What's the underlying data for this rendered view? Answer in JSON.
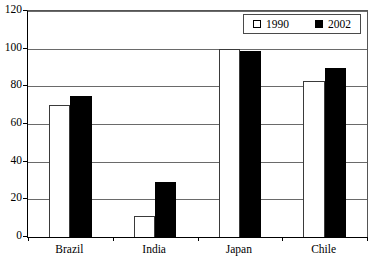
{
  "chart_data": {
    "type": "bar",
    "title": "",
    "subtitle": "",
    "xlabel": "",
    "ylabel": "",
    "categories": [
      "Brazil",
      "India",
      "Japan",
      "Chile"
    ],
    "series": [
      {
        "name": "1990",
        "values": [
          70,
          11,
          100,
          83
        ],
        "fill": "#ffffff",
        "stroke": "#3a3a3a"
      },
      {
        "name": "2002",
        "values": [
          75,
          29,
          99,
          90
        ],
        "fill": "#000000",
        "stroke": "#000000"
      }
    ],
    "ylim": [
      0,
      120
    ],
    "yticks": [
      0,
      20,
      40,
      60,
      80,
      100,
      120
    ],
    "ytick_labels": [
      "0",
      "20",
      "40",
      "60",
      "80",
      "100",
      "120"
    ],
    "grid": "horizontal",
    "legend_position": "top-right-inside",
    "annotations": []
  },
  "legend": {
    "entries": [
      {
        "label": "1990",
        "swatch": "hollow-square-icon"
      },
      {
        "label": "2002",
        "swatch": "filled-square-icon"
      }
    ]
  },
  "colors": {
    "background": "#ffffff",
    "axis": "#000000",
    "gridline": "#6a6a6a",
    "series_1990": "#ffffff",
    "series_2002": "#000000"
  }
}
